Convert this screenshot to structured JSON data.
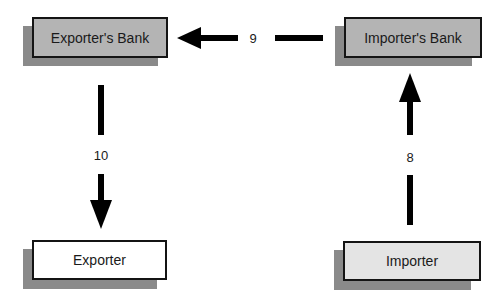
{
  "diagram": {
    "type": "flow",
    "nodes": [
      {
        "id": "exporters-bank",
        "label": "Exporter's Bank",
        "fill": "#b4b4b4"
      },
      {
        "id": "importers-bank",
        "label": "Importer's Bank",
        "fill": "#b4b4b4"
      },
      {
        "id": "exporter",
        "label": "Exporter",
        "fill": "#ffffff"
      },
      {
        "id": "importer",
        "label": "Importer",
        "fill": "#e4e4e4"
      }
    ],
    "edges": [
      {
        "from": "importer",
        "to": "importers-bank",
        "label": "8"
      },
      {
        "from": "importers-bank",
        "to": "exporters-bank",
        "label": "9"
      },
      {
        "from": "exporters-bank",
        "to": "exporter",
        "label": "10"
      }
    ],
    "colors": {
      "shadow": "#8a8a8a",
      "border": "#141414",
      "arrow": "#000000"
    }
  }
}
